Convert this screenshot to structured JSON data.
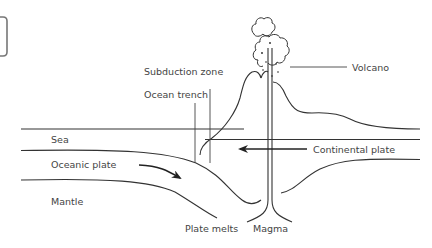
{
  "diagram": {
    "type": "cross-section",
    "labels": {
      "sea": "Sea",
      "oceanic_plate": "Oceanic plate",
      "mantle": "Mantle",
      "subduction_zone": "Subduction zone",
      "ocean_trench": "Ocean trench",
      "volcano": "Volcano",
      "continental_plate": "Continental plate",
      "plate_melts": "Plate melts",
      "magma": "Magma"
    },
    "arrows": [
      {
        "name": "oceanic-plate-motion",
        "direction": "right-down"
      },
      {
        "name": "continental-plate-motion",
        "direction": "left"
      }
    ],
    "colors": {
      "line": "#333333",
      "text": "#444444",
      "background": "#ffffff",
      "frame": "#777777"
    }
  }
}
